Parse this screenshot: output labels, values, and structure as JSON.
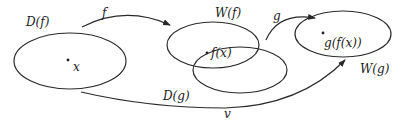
{
  "diagram": {
    "type": "function-composition-sets",
    "sets": [
      {
        "id": "domain-f",
        "label": "D(f)",
        "point": "x"
      },
      {
        "id": "range-f",
        "label": "W(f)",
        "point": "f(x)"
      },
      {
        "id": "domain-g",
        "label": "D(g)"
      },
      {
        "id": "range-g",
        "label": "W(g)",
        "point": "g(f(x))"
      }
    ],
    "arrows": [
      {
        "id": "f",
        "label": "f",
        "from": "D(f)",
        "to": "W(f)"
      },
      {
        "id": "g",
        "label": "g",
        "from": "W(f) ∩ D(g)",
        "to": "W(g)"
      },
      {
        "id": "v",
        "label": "v",
        "from": "D(f)",
        "to": "W(g)"
      }
    ]
  },
  "labels": {
    "domain_f": "D(f)",
    "point_x": "x",
    "arrow_f": "f",
    "range_f": "W(f)",
    "point_fx": "f(x)",
    "domain_g": "D(g)",
    "arrow_g": "g",
    "point_gfx": "g(f(x))",
    "range_g": "W(g)",
    "arrow_v": "v"
  },
  "colors": {
    "stroke": "#2a2a2a",
    "background": "#ffffff"
  }
}
